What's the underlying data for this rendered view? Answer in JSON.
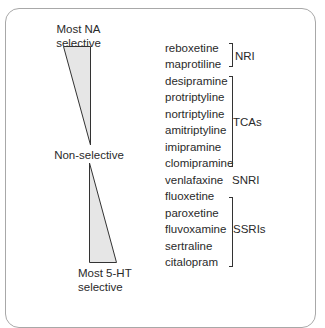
{
  "diagram": {
    "top_label": [
      "Most NA",
      "selective"
    ],
    "middle_label": "Non-selective",
    "bottom_label": [
      "Most 5-HT",
      "selective"
    ],
    "colors": {
      "triangle_fill": "#e6e6e6",
      "triangle_stroke": "#333333",
      "frame_border": "#a8a8a8",
      "text": "#2a2a2a"
    },
    "drugs": [
      "reboxetine",
      "maprotiline",
      "desipramine",
      "protriptyline",
      "nortriptyline",
      "amitriptyline",
      "imipramine",
      "clomipramine",
      "venlafaxine",
      "fluoxetine",
      "paroxetine",
      "fluvoxamine",
      "sertraline",
      "citalopram"
    ],
    "classes": [
      {
        "label": "NRI",
        "from": 0,
        "to": 1
      },
      {
        "label": "TCAs",
        "from": 2,
        "to": 7
      },
      {
        "label": "SNRI",
        "from": 8,
        "to": 8
      },
      {
        "label": "SSRIs",
        "from": 9,
        "to": 13
      }
    ]
  }
}
